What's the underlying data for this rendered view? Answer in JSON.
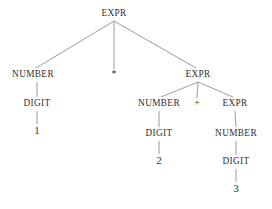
{
  "figure": {
    "kind": "parse-tree",
    "background_color": "#ffffff",
    "text_color": "#2f2f2f",
    "edge_color": "#8a8a8a"
  },
  "nodes": [
    {
      "id": "expr-root",
      "label": "EXPR",
      "x": 114,
      "y": 14,
      "type": "nonterminal"
    },
    {
      "id": "number-left",
      "label": "NUMBER",
      "x": 33,
      "y": 75,
      "type": "nonterminal"
    },
    {
      "id": "op-times",
      "label": "*",
      "x": 114,
      "y": 75,
      "type": "operator"
    },
    {
      "id": "expr-right",
      "label": "EXPR",
      "x": 198,
      "y": 75,
      "type": "nonterminal"
    },
    {
      "id": "digit-left",
      "label": "DIGIT",
      "x": 37,
      "y": 104,
      "type": "nonterminal"
    },
    {
      "id": "terminal-1",
      "label": "1",
      "x": 37,
      "y": 131,
      "type": "terminal"
    },
    {
      "id": "number-mid",
      "label": "NUMBER",
      "x": 159,
      "y": 104,
      "type": "nonterminal"
    },
    {
      "id": "op-plus",
      "label": "+",
      "x": 197,
      "y": 104,
      "type": "operator"
    },
    {
      "id": "expr-inner",
      "label": "EXPR",
      "x": 235,
      "y": 104,
      "type": "nonterminal"
    },
    {
      "id": "digit-mid",
      "label": "DIGIT",
      "x": 159,
      "y": 134,
      "type": "nonterminal"
    },
    {
      "id": "terminal-2",
      "label": "2",
      "x": 159,
      "y": 161,
      "type": "terminal"
    },
    {
      "id": "number-inner",
      "label": "NUMBER",
      "x": 236,
      "y": 134,
      "type": "nonterminal"
    },
    {
      "id": "digit-inner",
      "label": "DIGIT",
      "x": 236,
      "y": 162,
      "type": "nonterminal"
    },
    {
      "id": "terminal-3",
      "label": "3",
      "x": 236,
      "y": 189,
      "type": "terminal"
    }
  ],
  "edges": [
    {
      "id": "edge-root-number-left",
      "from": "expr-root",
      "to": "number-left",
      "x1": 114,
      "y1": 21,
      "x2": 36,
      "y2": 68
    },
    {
      "id": "edge-root-times",
      "from": "expr-root",
      "to": "op-times",
      "x1": 114,
      "y1": 21,
      "x2": 114,
      "y2": 69
    },
    {
      "id": "edge-root-expr-right",
      "from": "expr-root",
      "to": "expr-right",
      "x1": 114,
      "y1": 21,
      "x2": 196,
      "y2": 68
    },
    {
      "id": "edge-numberleft-digit",
      "from": "number-left",
      "to": "digit-left",
      "x1": 37,
      "y1": 82,
      "x2": 37,
      "y2": 97
    },
    {
      "id": "edge-digit-one",
      "from": "digit-left",
      "to": "terminal-1",
      "x1": 37,
      "y1": 111,
      "x2": 37,
      "y2": 124
    },
    {
      "id": "edge-exprright-number",
      "from": "expr-right",
      "to": "number-mid",
      "x1": 198,
      "y1": 82,
      "x2": 161,
      "y2": 97
    },
    {
      "id": "edge-exprright-plus",
      "from": "expr-right",
      "to": "op-plus",
      "x1": 198,
      "y1": 82,
      "x2": 197,
      "y2": 98
    },
    {
      "id": "edge-exprright-expr",
      "from": "expr-right",
      "to": "expr-inner",
      "x1": 198,
      "y1": 82,
      "x2": 233,
      "y2": 97
    },
    {
      "id": "edge-numbermid-digit",
      "from": "number-mid",
      "to": "digit-mid",
      "x1": 159,
      "y1": 111,
      "x2": 159,
      "y2": 127
    },
    {
      "id": "edge-digitmid-two",
      "from": "digit-mid",
      "to": "terminal-2",
      "x1": 159,
      "y1": 141,
      "x2": 159,
      "y2": 154
    },
    {
      "id": "edge-exprinner-number",
      "from": "expr-inner",
      "to": "number-inner",
      "x1": 235,
      "y1": 111,
      "x2": 236,
      "y2": 127
    },
    {
      "id": "edge-numberinner-digit",
      "from": "number-inner",
      "to": "digit-inner",
      "x1": 236,
      "y1": 141,
      "x2": 236,
      "y2": 155
    },
    {
      "id": "edge-digitinner-three",
      "from": "digit-inner",
      "to": "terminal-3",
      "x1": 236,
      "y1": 169,
      "x2": 236,
      "y2": 182
    }
  ]
}
